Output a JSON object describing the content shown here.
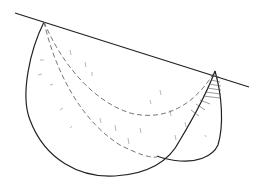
{
  "diagram": {
    "type": "geometric-sketch",
    "description": "Two overlapping lobe shapes hanging from a slanted tangent line, with dashed interior arcs and hatching",
    "colors": {
      "stroke": "#222222",
      "dashed": "#666666",
      "hatch": "#555555",
      "background": "#ffffff"
    },
    "elements": {
      "tangent_line": "slanted line",
      "large_lobe": "large lobe",
      "small_lobe": "small lobe",
      "dashed_arc_upper": "dashed arc",
      "dashed_arc_lower": "dashed arc",
      "hatching": "hatched region"
    }
  }
}
